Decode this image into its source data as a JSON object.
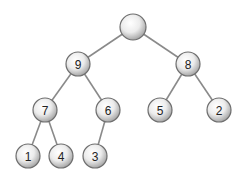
{
  "diagram": {
    "type": "binary-tree",
    "nodes": [
      {
        "id": "root",
        "label": "",
        "x": 133,
        "y": 27
      },
      {
        "id": "n9",
        "label": "9",
        "x": 78,
        "y": 64
      },
      {
        "id": "n8",
        "label": "8",
        "x": 188,
        "y": 64
      },
      {
        "id": "n7",
        "label": "7",
        "x": 45,
        "y": 110
      },
      {
        "id": "n6",
        "label": "6",
        "x": 108,
        "y": 110
      },
      {
        "id": "n5",
        "label": "5",
        "x": 160,
        "y": 110
      },
      {
        "id": "n2",
        "label": "2",
        "x": 219,
        "y": 110
      },
      {
        "id": "n1",
        "label": "1",
        "x": 28,
        "y": 156
      },
      {
        "id": "n4",
        "label": "4",
        "x": 61,
        "y": 156
      },
      {
        "id": "n3",
        "label": "3",
        "x": 95,
        "y": 156
      }
    ],
    "edges": [
      [
        "root",
        "n9"
      ],
      [
        "root",
        "n8"
      ],
      [
        "n9",
        "n7"
      ],
      [
        "n9",
        "n6"
      ],
      [
        "n8",
        "n5"
      ],
      [
        "n8",
        "n2"
      ],
      [
        "n7",
        "n1"
      ],
      [
        "n7",
        "n4"
      ],
      [
        "n6",
        "n3"
      ]
    ],
    "colors": {
      "edge": "#8a8a8a",
      "node_fill_center": "#ffffff",
      "node_fill_edge": "#a8a8a8",
      "node_stroke": "#6e6e6e",
      "label": "#222222"
    }
  }
}
